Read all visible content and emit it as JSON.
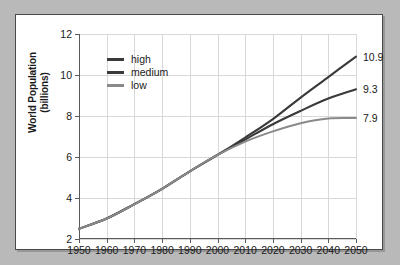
{
  "chart_data": {
    "type": "line",
    "title": "",
    "xlabel": "",
    "ylabel": "World Population (billions)",
    "ylabel_line1": "World Population",
    "ylabel_line2": "(billions)",
    "xlim": [
      1950,
      2050
    ],
    "ylim": [
      2,
      12
    ],
    "grid": true,
    "legend_position": "top-left",
    "xticks": [
      1950,
      1960,
      1970,
      1980,
      1990,
      2000,
      2010,
      2020,
      2030,
      2040,
      2050
    ],
    "yticks": [
      2,
      4,
      6,
      8,
      10,
      12
    ],
    "x": [
      1950,
      1960,
      1970,
      1980,
      1990,
      2000,
      2010,
      2020,
      2030,
      2040,
      2050
    ],
    "series": [
      {
        "name": "high",
        "color": "#3a3a3a",
        "end_label": "10.9",
        "values": [
          2.5,
          3.0,
          3.7,
          4.45,
          5.3,
          6.1,
          6.95,
          7.85,
          8.9,
          9.9,
          10.9
        ]
      },
      {
        "name": "medium",
        "color": "#3a3a3a",
        "end_label": "9.3",
        "values": [
          2.5,
          3.0,
          3.7,
          4.45,
          5.3,
          6.1,
          6.85,
          7.6,
          8.25,
          8.85,
          9.3
        ]
      },
      {
        "name": "low",
        "color": "#8a8a8a",
        "end_label": "7.9",
        "values": [
          2.5,
          3.0,
          3.7,
          4.45,
          5.3,
          6.1,
          6.75,
          7.25,
          7.65,
          7.88,
          7.9
        ]
      }
    ]
  },
  "style": {
    "page_background": "#b9b9b9",
    "card_background": "#ffffff",
    "card_border": "#4a4a4a",
    "gridline_color": "#d8d8d8",
    "axis_color": "#5a5a5a",
    "text_color": "#1a1a1a"
  }
}
